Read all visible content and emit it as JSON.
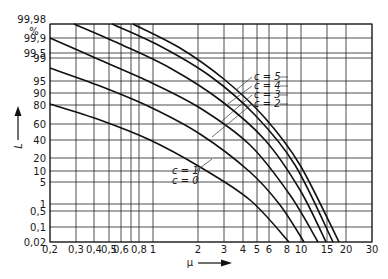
{
  "chart_data": {
    "type": "line",
    "title": "",
    "xlabel": "μ",
    "ylabel": "L",
    "y_unit": "%",
    "x_scale": "log",
    "y_scale": "probability",
    "xlim": [
      0.2,
      30
    ],
    "ylim": [
      0.02,
      99.98
    ],
    "grid": true,
    "x_ticks": [
      "0,2",
      "0,3",
      "0,4",
      "0,5",
      "0,6",
      "0,8",
      "1",
      "2",
      "3",
      "4",
      "5",
      "6",
      "8",
      "10",
      "15",
      "20",
      "30"
    ],
    "y_ticks": [
      "99,98",
      "99,9",
      "99,5",
      "99",
      "95",
      "90",
      "80",
      "60",
      "40",
      "20",
      "10",
      "5",
      "1",
      "0,5",
      "0,1",
      "0,02"
    ],
    "series": [
      {
        "name": "c=0",
        "points": [
          [
            0.2,
            80
          ],
          [
            0.43,
            65
          ],
          [
            0.93,
            40
          ],
          [
            2.0,
            12
          ],
          [
            4.3,
            1.5
          ],
          [
            8.3,
            0.02
          ]
        ]
      },
      {
        "name": "c=1",
        "points": [
          [
            0.2,
            99
          ],
          [
            0.43,
            95
          ],
          [
            0.93,
            85
          ],
          [
            2.0,
            55
          ],
          [
            4.3,
            12
          ],
          [
            6.7,
            1
          ],
          [
            10.6,
            0.02
          ]
        ]
      },
      {
        "name": "c=2",
        "points": [
          [
            0.2,
            99.9
          ],
          [
            0.43,
            99.4
          ],
          [
            0.93,
            96
          ],
          [
            2.0,
            85
          ],
          [
            4.3,
            35
          ],
          [
            8.0,
            3
          ],
          [
            13.1,
            0.02
          ]
        ]
      },
      {
        "name": "c=3",
        "points": [
          [
            0.29,
            99.98
          ],
          [
            0.59,
            99.85
          ],
          [
            1.27,
            99
          ],
          [
            2.7,
            90
          ],
          [
            5.4,
            45
          ],
          [
            9.3,
            5
          ],
          [
            14.9,
            0.02
          ]
        ]
      },
      {
        "name": "c=4",
        "points": [
          [
            0.52,
            99.98
          ],
          [
            1.09,
            99.8
          ],
          [
            2.3,
            98
          ],
          [
            4.6,
            75
          ],
          [
            8.6,
            15
          ],
          [
            16.5,
            0.02
          ]
        ]
      },
      {
        "name": "c=5",
        "points": [
          [
            0.72,
            99.98
          ],
          [
            1.49,
            99.8
          ],
          [
            3.0,
            96
          ],
          [
            5.4,
            70
          ],
          [
            9.3,
            15
          ],
          [
            18.7,
            0.02
          ]
        ]
      }
    ],
    "annotations": [
      "c = 5",
      "c = 4",
      "c = 3",
      "c = 2",
      "c = 1",
      "c = 0"
    ],
    "legend": "inline labels with leader lines"
  },
  "render": {
    "x_tick_px": [
      50,
      76,
      94,
      109,
      121,
      139,
      153,
      198,
      224,
      243,
      257,
      269,
      287,
      301,
      327,
      346,
      372
    ],
    "y_tick_px": [
      24,
      38,
      53,
      58,
      81,
      93,
      105,
      124,
      140,
      158,
      171,
      182,
      204,
      211,
      227,
      242
    ],
    "curves_px": [
      "50,104 100,120 150,140 200,167 250,200 289,242",
      "50,68 100,86 150,107 200,134 250,172 280,205 304,242",
      "50,38 100,60 150,82 200,108 250,145 290,195 318,242",
      "74,24 120,44 170,68 220,100 265,140 300,190 326,242",
      "112,24 160,46 210,76 255,115 295,165 333,242",
      "133,24 180,48 225,80 265,118 300,165 339,242"
    ],
    "labels_px": [
      {
        "text": "c = 5",
        "x": 254,
        "y": 80,
        "lx": 236,
        "ly": 90
      },
      {
        "text": "c = 4",
        "x": 254,
        "y": 89,
        "lx": 225,
        "ly": 106
      },
      {
        "text": "c = 3",
        "x": 254,
        "y": 98,
        "lx": 222,
        "ly": 121
      },
      {
        "text": "c = 2",
        "x": 254,
        "y": 107,
        "lx": 212,
        "ly": 137
      },
      {
        "text": "c = 1",
        "x": 172,
        "y": 174,
        "lx": 212,
        "ly": 159
      },
      {
        "text": "c = 0",
        "x": 172,
        "y": 184,
        "lx": 200,
        "ly": 168
      }
    ]
  }
}
